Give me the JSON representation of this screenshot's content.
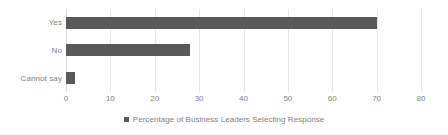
{
  "chart_data": {
    "type": "bar",
    "orientation": "horizontal",
    "title": "",
    "subtitle": "",
    "categories": [
      "Yes",
      "No",
      "Cannot say"
    ],
    "values": [
      70,
      28,
      2
    ],
    "series": [
      {
        "name": "Percentage of Business Leaders Selecting Response",
        "values": [
          70,
          28,
          2
        ],
        "color": "#595959"
      }
    ],
    "xlabel": "",
    "ylabel": "",
    "xlim": [
      0,
      80
    ],
    "xticks": [
      0,
      10,
      20,
      30,
      40,
      50,
      60,
      70,
      80
    ],
    "xtick_labels": [
      "0",
      "10",
      "20",
      "30",
      "40",
      "50",
      "60",
      "70",
      "80"
    ],
    "grid": "vertical",
    "legend_position": "bottom",
    "legend_entries": [
      "Percentage of Business Leaders Selecting Response"
    ]
  },
  "legend": {
    "label": "Percentage of Business Leaders Selecting Response",
    "marker_color": "#595959"
  },
  "colors": {
    "bar": "#595959",
    "gridline": "#e6e6e6",
    "axis": "#d9d9d9",
    "text": "#7f7f7f",
    "background": "#ffffff"
  }
}
